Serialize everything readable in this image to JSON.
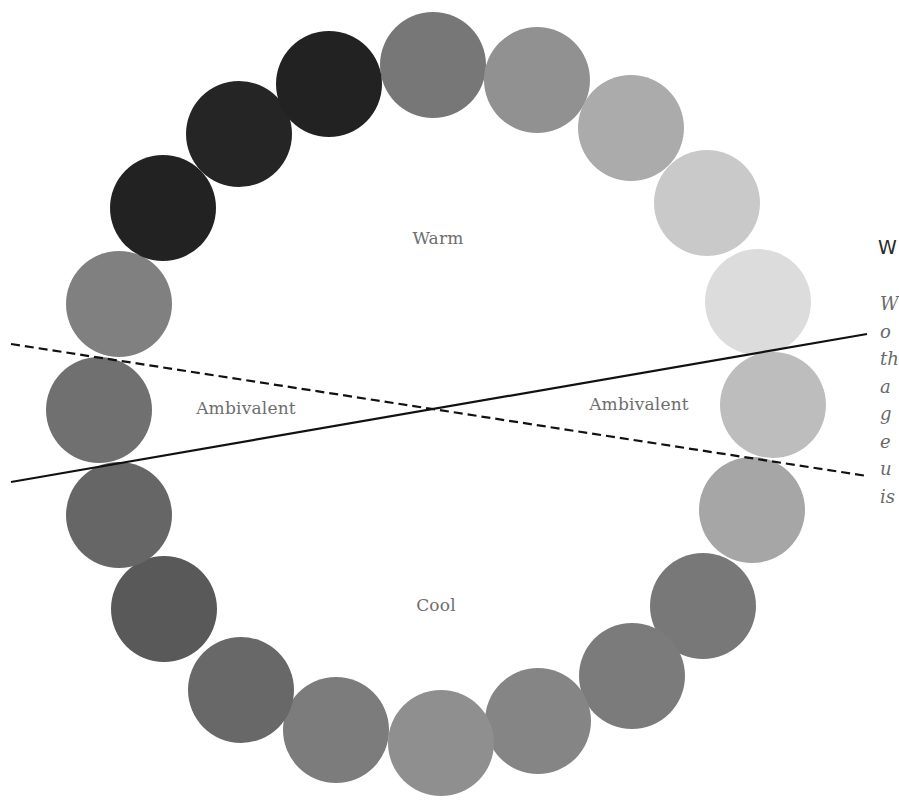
{
  "diagram": {
    "type": "color-wheel-temperature",
    "circle_radius": 53,
    "circles": [
      {
        "id": 1,
        "cx": 433,
        "cy": 65,
        "color": "#777777"
      },
      {
        "id": 2,
        "cx": 537,
        "cy": 80,
        "color": "#919191"
      },
      {
        "id": 3,
        "cx": 631,
        "cy": 128,
        "color": "#ababab"
      },
      {
        "id": 4,
        "cx": 707,
        "cy": 203,
        "color": "#c9c9c9"
      },
      {
        "id": 5,
        "cx": 758,
        "cy": 302,
        "color": "#dcdcdc"
      },
      {
        "id": 6,
        "cx": 773,
        "cy": 405,
        "color": "#bdbdbd"
      },
      {
        "id": 7,
        "cx": 752,
        "cy": 510,
        "color": "#a6a6a6"
      },
      {
        "id": 8,
        "cx": 703,
        "cy": 606,
        "color": "#787878"
      },
      {
        "id": 9,
        "cx": 632,
        "cy": 676,
        "color": "#7b7b7b"
      },
      {
        "id": 10,
        "cx": 538,
        "cy": 721,
        "color": "#858585"
      },
      {
        "id": 11,
        "cx": 441,
        "cy": 743,
        "color": "#8f8f8f"
      },
      {
        "id": 12,
        "cx": 336,
        "cy": 730,
        "color": "#7c7c7c"
      },
      {
        "id": 13,
        "cx": 241,
        "cy": 690,
        "color": "#686868"
      },
      {
        "id": 14,
        "cx": 164,
        "cy": 609,
        "color": "#595959"
      },
      {
        "id": 15,
        "cx": 119,
        "cy": 515,
        "color": "#666666"
      },
      {
        "id": 16,
        "cx": 99,
        "cy": 410,
        "color": "#707070"
      },
      {
        "id": 17,
        "cx": 119,
        "cy": 304,
        "color": "#808080"
      },
      {
        "id": 18,
        "cx": 163,
        "cy": 208,
        "color": "#222222"
      },
      {
        "id": 19,
        "cx": 239,
        "cy": 134,
        "color": "#252525"
      },
      {
        "id": 20,
        "cx": 329,
        "cy": 84,
        "color": "#222222"
      }
    ],
    "lines": [
      {
        "style": "solid",
        "x1": 11,
        "y1": 482,
        "x2": 867,
        "y2": 334,
        "color": "#111111"
      },
      {
        "style": "dashed",
        "x1": 11,
        "y1": 344,
        "x2": 867,
        "y2": 476,
        "color": "#111111"
      }
    ],
    "labels": {
      "warm": "Warm",
      "cool": "Cool",
      "ambivalent_left": "Ambivalent",
      "ambivalent_right": "Ambivalent"
    }
  },
  "side_panel": {
    "title": "W",
    "body_lines": [
      "W",
      "o",
      "th",
      "a",
      "g",
      "e",
      "u",
      "is"
    ]
  }
}
